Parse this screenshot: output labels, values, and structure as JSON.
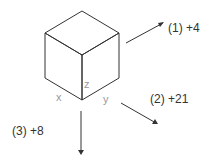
{
  "diagram": {
    "cube": {
      "axes": {
        "x": "x",
        "y": "y",
        "z": "z"
      }
    },
    "rotations": [
      {
        "id": 1,
        "label": "(1) +4",
        "direction": "up-right"
      },
      {
        "id": 2,
        "label": "(2) +21",
        "direction": "down-right"
      },
      {
        "id": 3,
        "label": "(3) +8",
        "direction": "down"
      }
    ],
    "colors": {
      "line": "#333333",
      "axis_label": "#999999"
    }
  }
}
